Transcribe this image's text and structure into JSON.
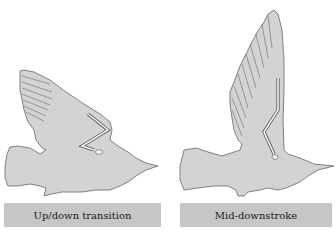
{
  "figure": {
    "panels": [
      {
        "id": "left",
        "label": "Up/down transition",
        "silhouette_color": "#d3d3d3",
        "outline_color": "#555555"
      },
      {
        "id": "right",
        "label": "Mid-downstroke",
        "silhouette_color": "#d3d3d3",
        "outline_color": "#555555"
      }
    ],
    "label_box_color": "#c6c6c6"
  }
}
